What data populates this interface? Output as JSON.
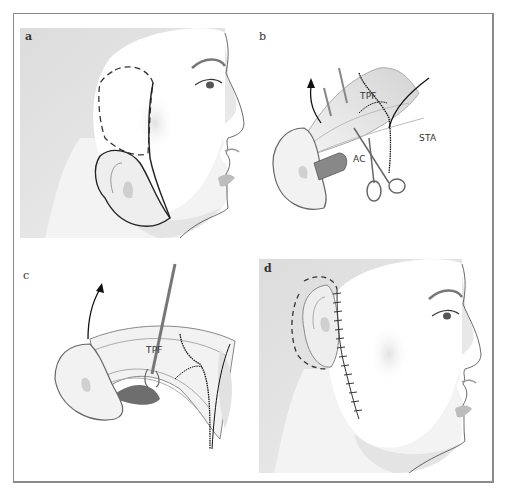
{
  "figure": {
    "panels": [
      {
        "id": "a",
        "label": "a",
        "description": "face profile, dashed outline above ear, ear outline"
      },
      {
        "id": "b",
        "label": "b",
        "annotations": {
          "tpf": "TPF",
          "sta": "STA",
          "ac": "AC"
        }
      },
      {
        "id": "c",
        "label": "c",
        "annotations": {
          "tpf": "TPF"
        }
      },
      {
        "id": "d",
        "label": "d",
        "description": "face profile with repositioned ear and sutured incision"
      }
    ]
  },
  "colors": {
    "frame": "#8a8a8a",
    "shade_bg": "#e6e6e6",
    "line": "#222222",
    "skin": "#ffffff"
  }
}
